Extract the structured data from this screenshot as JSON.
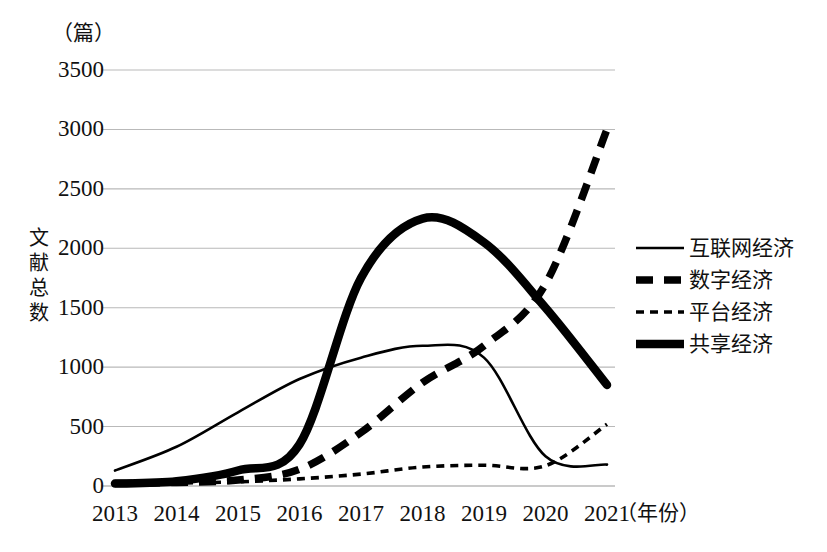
{
  "axes": {
    "unit_label": "（篇）",
    "y_axis_title": "文献总数",
    "x_axis_title": "（年份）",
    "y_ticks": [
      "0",
      "500",
      "1000",
      "1500",
      "2000",
      "2500",
      "3000",
      "3500"
    ],
    "x_ticks": [
      "2013",
      "2014",
      "2015",
      "2016",
      "2017",
      "2018",
      "2019",
      "2020",
      "2021"
    ]
  },
  "legend": {
    "items": [
      {
        "label": "互联网经济",
        "style": "thin-solid"
      },
      {
        "label": "数字经济",
        "style": "thick-dashed"
      },
      {
        "label": "平台经济",
        "style": "thin-dotted"
      },
      {
        "label": "共享经济",
        "style": "extra-thick-solid"
      }
    ]
  },
  "colors": {
    "line": "#000000",
    "gridline": "#b9b9b9",
    "background": "#ffffff",
    "text": "#111111"
  },
  "chart_data": {
    "type": "line",
    "title": "",
    "xlabel": "（年份）",
    "ylabel": "文献总数",
    "unit": "篇",
    "x": [
      2013,
      2014,
      2015,
      2016,
      2017,
      2018,
      2019,
      2020,
      2021
    ],
    "xlim": [
      2013,
      2021
    ],
    "ylim": [
      0,
      3500
    ],
    "ytick_step": 500,
    "grid": true,
    "legend_position": "right",
    "series": [
      {
        "name": "互联网经济",
        "style": "thin-solid",
        "values": [
          130,
          330,
          620,
          900,
          1080,
          1180,
          1080,
          250,
          180
        ]
      },
      {
        "name": "数字经济",
        "style": "thick-dashed",
        "values": [
          20,
          30,
          50,
          140,
          450,
          870,
          1180,
          1700,
          3000
        ]
      },
      {
        "name": "平台经济",
        "style": "thin-dotted",
        "values": [
          20,
          25,
          35,
          60,
          100,
          160,
          175,
          170,
          520
        ]
      },
      {
        "name": "共享经济",
        "style": "extra-thick-solid",
        "values": [
          20,
          40,
          130,
          350,
          1750,
          2250,
          2050,
          1500,
          850
        ]
      }
    ]
  }
}
